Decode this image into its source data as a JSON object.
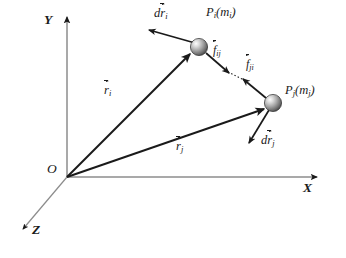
{
  "figure": {
    "type": "physics-vector-diagram",
    "background_color": "#ffffff",
    "line_color": "#1a1a1a",
    "axis_color": "#8c8c8c",
    "particle_fill_light": "#f2f2f2",
    "particle_fill_dark": "#4a4a4a"
  },
  "axes": [
    {
      "name": "y-axis",
      "label": "Y",
      "from": [
        67,
        177
      ],
      "to": [
        67,
        14
      ],
      "label_pos": [
        46,
        20
      ]
    },
    {
      "name": "x-axis",
      "label": "X",
      "from": [
        67,
        177
      ],
      "to": [
        320,
        177
      ],
      "label_pos": [
        305,
        184
      ]
    },
    {
      "name": "z-axis",
      "label": "Z",
      "from": [
        67,
        177
      ],
      "to": [
        20,
        232
      ],
      "label_pos": [
        33,
        228
      ]
    }
  ],
  "origin": {
    "label": "O",
    "pos": [
      67,
      177
    ],
    "label_pos": [
      49,
      166
    ]
  },
  "particles": [
    {
      "name": "particle-i",
      "label": "P",
      "label_sub": "i",
      "mass_open": "(",
      "mass": "m",
      "mass_sub": "i",
      "mass_close": ")",
      "label_full": "P_i(m_i)",
      "pos": [
        199,
        47
      ],
      "radius": 8.5,
      "label_pos": [
        208,
        10
      ]
    },
    {
      "name": "particle-j",
      "label": "P",
      "label_sub": "j",
      "mass_open": "(",
      "mass": "m",
      "mass_sub": "j",
      "mass_close": ")",
      "label_full": "P_j(m_j)",
      "pos": [
        273,
        103
      ],
      "radius": 8.5,
      "label_pos": [
        286,
        87
      ]
    }
  ],
  "position_vectors": [
    {
      "name": "position-vector-i",
      "symbol": "r",
      "sub": "i",
      "label_full": "r_i",
      "from": [
        67,
        177
      ],
      "to": [
        191,
        53
      ],
      "label_pos": [
        106,
        86
      ]
    },
    {
      "name": "position-vector-j",
      "symbol": "r",
      "sub": "j",
      "label_full": "r_j",
      "from": [
        67,
        177
      ],
      "to": [
        265,
        108
      ],
      "label_pos": [
        178,
        142
      ]
    }
  ],
  "displacement_vectors": [
    {
      "name": "displacement-i",
      "prefix": "d",
      "symbol": "r",
      "sub": "i",
      "label_full": "dr_i",
      "from": [
        194,
        43
      ],
      "to": [
        148,
        29
      ],
      "label_pos": [
        156,
        10
      ]
    },
    {
      "name": "displacement-j",
      "prefix": "d",
      "symbol": "r",
      "sub": "j",
      "label_full": "dr_j",
      "from": [
        268,
        110
      ],
      "to": [
        248,
        144
      ],
      "label_pos": [
        263,
        138
      ]
    }
  ],
  "forces": [
    {
      "name": "force-ij",
      "symbol": "f",
      "sub": "ij",
      "label_full": "f_ij",
      "from": [
        206,
        53
      ],
      "to": [
        228,
        72
      ],
      "label_pos": [
        214,
        46
      ]
    },
    {
      "name": "force-ji",
      "symbol": "f",
      "sub": "ji",
      "label_full": "f_ji",
      "from": [
        265,
        97
      ],
      "to": [
        243,
        79
      ],
      "label_pos": [
        247,
        60
      ]
    }
  ],
  "connector": {
    "name": "force-line-of-action",
    "style": "dotted",
    "from": [
      228,
      72
    ],
    "to": [
      244,
      80
    ]
  }
}
